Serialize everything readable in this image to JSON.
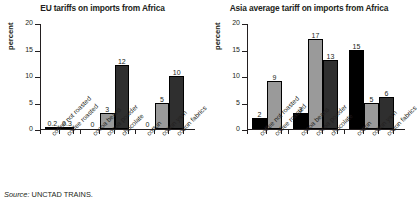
{
  "source": {
    "prefix": "Source:",
    "text": "UNCTAD TRAINS."
  },
  "palette": {
    "black": "#000000",
    "gray": "#9a9a9a",
    "dark": "#2f2f2f",
    "axis": "#231f20"
  },
  "chart_data": [
    {
      "type": "bar",
      "title": "EU tariffs on imports from Africa",
      "xlabel": "",
      "ylabel": "percent",
      "ylim": [
        0,
        20
      ],
      "yticks": [
        0,
        5,
        10,
        15,
        20
      ],
      "ytick_labels": [
        "0",
        "5",
        "10",
        "15",
        "20"
      ],
      "grid": false,
      "legend": "none",
      "categories": [
        "coffee not roasted",
        "coffee roasted",
        "cocoa beans",
        "cocoa powder",
        "chocolate",
        "cotton",
        "cotton yarn",
        "cotton fabrics"
      ],
      "values": [
        0.2,
        0.3,
        0,
        3,
        12,
        0,
        5,
        10
      ],
      "value_labels": [
        "0.2",
        "0.3",
        "0",
        "3",
        "12",
        "0",
        "5",
        "10"
      ],
      "bar_colors": [
        "#000000",
        "#9a9a9a",
        "#000000",
        "#9a9a9a",
        "#2f2f2f",
        "#000000",
        "#9a9a9a",
        "#2f2f2f"
      ],
      "groups": [
        {
          "name": "coffee",
          "count": 2
        },
        {
          "name": "cocoa",
          "count": 3
        },
        {
          "name": "cotton",
          "count": 3
        }
      ]
    },
    {
      "type": "bar",
      "title": "Asia average tariff on imports from Africa",
      "xlabel": "",
      "ylabel": "percent",
      "ylim": [
        0,
        20
      ],
      "yticks": [
        0,
        5,
        10,
        15,
        20
      ],
      "ytick_labels": [
        "0",
        "5",
        "10",
        "15",
        "20"
      ],
      "grid": false,
      "legend": "none",
      "categories": [
        "coffee not roasted",
        "coffee roasted",
        "cocoa beans",
        "cocoa powder",
        "chocolate",
        "cotton",
        "cotton yarn",
        "cotton fabrics"
      ],
      "values": [
        2,
        9,
        3,
        17,
        13,
        15,
        5,
        6
      ],
      "value_labels": [
        "2",
        "9",
        "3",
        "17",
        "13",
        "15",
        "5",
        "6"
      ],
      "bar_colors": [
        "#000000",
        "#9a9a9a",
        "#000000",
        "#9a9a9a",
        "#2f2f2f",
        "#000000",
        "#9a9a9a",
        "#2f2f2f"
      ],
      "groups": [
        {
          "name": "coffee",
          "count": 2
        },
        {
          "name": "cocoa",
          "count": 3
        },
        {
          "name": "cotton",
          "count": 3
        }
      ]
    }
  ]
}
